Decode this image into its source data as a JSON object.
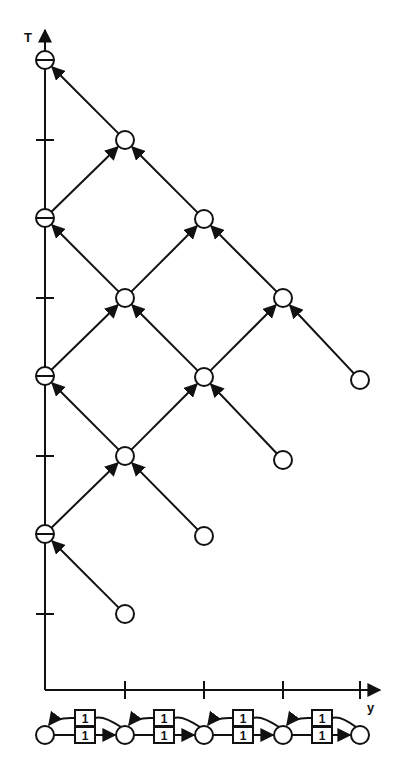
{
  "diagram": {
    "axes": {
      "vertical_label": "T",
      "horizontal_label": "y",
      "origin": [
        45,
        690
      ],
      "t_ticks_y": [
        140,
        298,
        456,
        614
      ],
      "y_ticks_x": [
        125,
        204,
        283,
        360
      ]
    },
    "t_axis_nodes": [
      {
        "id": "t0",
        "x": 45,
        "y": 60,
        "mark": "minus"
      },
      {
        "id": "t1",
        "x": 45,
        "y": 218,
        "mark": "minus"
      },
      {
        "id": "t2",
        "x": 45,
        "y": 376,
        "mark": "minus"
      },
      {
        "id": "t3",
        "x": 45,
        "y": 534,
        "mark": "minus"
      }
    ],
    "nodes": [
      {
        "id": "a0",
        "x": 125,
        "y": 140
      },
      {
        "id": "a1",
        "x": 125,
        "y": 298
      },
      {
        "id": "a2",
        "x": 125,
        "y": 456
      },
      {
        "id": "a3",
        "x": 125,
        "y": 614
      },
      {
        "id": "b0",
        "x": 204,
        "y": 219
      },
      {
        "id": "b1",
        "x": 204,
        "y": 377
      },
      {
        "id": "b2",
        "x": 204,
        "y": 536
      },
      {
        "id": "c0",
        "x": 283,
        "y": 298
      },
      {
        "id": "c1",
        "x": 283,
        "y": 460
      },
      {
        "id": "d0",
        "x": 360,
        "y": 380
      }
    ],
    "edges": [
      {
        "from": "a0",
        "to": "t0"
      },
      {
        "from": "t1",
        "to": "a0"
      },
      {
        "from": "b0",
        "to": "a0"
      },
      {
        "from": "a1",
        "to": "t1"
      },
      {
        "from": "a1",
        "to": "b0"
      },
      {
        "from": "c0",
        "to": "b0"
      },
      {
        "from": "t2",
        "to": "a1"
      },
      {
        "from": "b1",
        "to": "a1"
      },
      {
        "from": "b1",
        "to": "c0"
      },
      {
        "from": "d0",
        "to": "c0"
      },
      {
        "from": "a2",
        "to": "t2"
      },
      {
        "from": "a2",
        "to": "b1"
      },
      {
        "from": "c1",
        "to": "b1"
      },
      {
        "from": "t3",
        "to": "a2"
      },
      {
        "from": "b2",
        "to": "a2"
      },
      {
        "from": "a3",
        "to": "t3"
      }
    ],
    "chain": {
      "places": [
        {
          "id": "p0",
          "x": 45
        },
        {
          "id": "p1",
          "x": 125
        },
        {
          "id": "p2",
          "x": 204
        },
        {
          "id": "p3",
          "x": 283
        },
        {
          "id": "p4",
          "x": 360
        }
      ],
      "y": 735,
      "transitions": [
        {
          "x": 85,
          "top_label": "1",
          "bottom_label": "1"
        },
        {
          "x": 164,
          "top_label": "1",
          "bottom_label": "1"
        },
        {
          "x": 243,
          "top_label": "1",
          "bottom_label": "1"
        },
        {
          "x": 322,
          "top_label": "1",
          "bottom_label": "1"
        }
      ]
    },
    "colors": {
      "stroke": "#111111",
      "background": "#ffffff"
    }
  }
}
